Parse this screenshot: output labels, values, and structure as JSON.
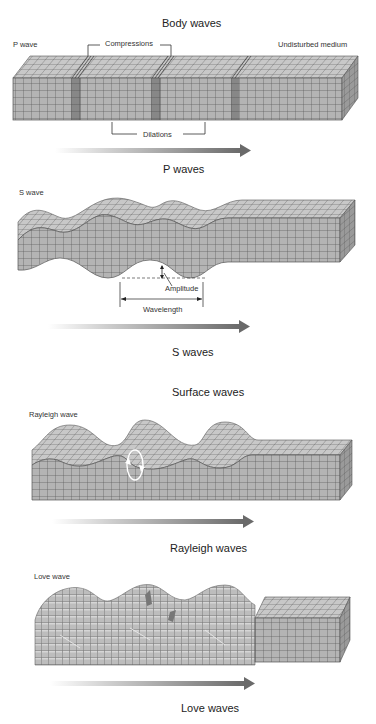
{
  "body_waves": {
    "title": "Body waves",
    "p_wave": {
      "label": "P wave",
      "compressions_label": "Compressions",
      "undisturbed_label": "Undisturbed medium",
      "dilations_label": "Dilations",
      "caption": "P waves"
    },
    "s_wave": {
      "label": "S wave",
      "amplitude_label": "Amplitude",
      "wavelength_label": "Wavelength",
      "caption": "S waves"
    }
  },
  "surface_waves": {
    "title": "Surface waves",
    "rayleigh": {
      "label": "Rayleigh wave",
      "caption": "Rayleigh waves"
    },
    "love": {
      "label": "Love wave",
      "caption": "Love waves"
    }
  },
  "colors": {
    "block_fill": "#b4b4b4",
    "block_top": "#c8c8c8",
    "block_side": "#9a9a9a",
    "grid_line": "#555555",
    "arrow_dark": "#666666",
    "arrow_light": "#eeeeee"
  },
  "icons": {
    "direction_arrow": "right-arrow-gradient",
    "particle_motion": "elliptical-orbit-arrows"
  }
}
